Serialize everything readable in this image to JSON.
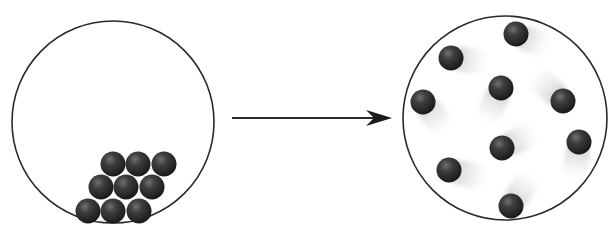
{
  "diagram": {
    "colors": {
      "background": "#ffffff",
      "outline": "#2a2a2a",
      "ball_dark": "#1e1e1e",
      "ball_mid": "#3c3c3c",
      "ball_highlight": "#6a6a6a",
      "motion_trail": "#c8c8c8"
    },
    "left_container": {
      "label": "packed-particles",
      "cx": 113,
      "cy": 122,
      "r": 101,
      "particles": [
        {
          "x": 113,
          "y": 164
        },
        {
          "x": 138,
          "y": 164
        },
        {
          "x": 164,
          "y": 164
        },
        {
          "x": 101,
          "y": 187
        },
        {
          "x": 126,
          "y": 187
        },
        {
          "x": 152,
          "y": 187
        },
        {
          "x": 88,
          "y": 211
        },
        {
          "x": 113,
          "y": 211
        },
        {
          "x": 139,
          "y": 211
        }
      ],
      "particle_radius": 12.5
    },
    "arrow": {
      "label": "transition-arrow",
      "x1": 232,
      "y1": 118,
      "x2": 392,
      "y2": 118
    },
    "right_container": {
      "label": "dispersed-particles",
      "cx": 505,
      "cy": 118,
      "r": 102,
      "particles": [
        {
          "x": 516,
          "y": 34,
          "trail_dx": 28,
          "trail_dy": 12
        },
        {
          "x": 451,
          "y": 58,
          "trail_dx": 32,
          "trail_dy": 4
        },
        {
          "x": 423,
          "y": 102,
          "trail_dx": 20,
          "trail_dy": 24
        },
        {
          "x": 501,
          "y": 88,
          "trail_dx": -14,
          "trail_dy": 30
        },
        {
          "x": 563,
          "y": 101,
          "trail_dx": -26,
          "trail_dy": -24
        },
        {
          "x": 502,
          "y": 148,
          "trail_dx": 30,
          "trail_dy": -14
        },
        {
          "x": 579,
          "y": 142,
          "trail_dx": -4,
          "trail_dy": 32
        },
        {
          "x": 449,
          "y": 170,
          "trail_dx": 34,
          "trail_dy": 8
        },
        {
          "x": 511,
          "y": 206,
          "trail_dx": 18,
          "trail_dy": -28
        }
      ],
      "particle_radius": 12.5
    }
  }
}
